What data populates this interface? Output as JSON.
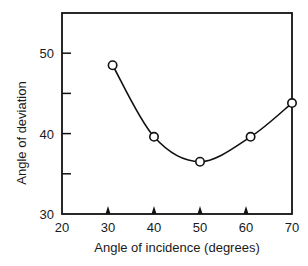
{
  "chart_data": {
    "type": "line",
    "title": "",
    "xlabel": "Angle of incidence (degrees)",
    "ylabel": "Angle of deviation",
    "xlim": [
      20,
      70
    ],
    "ylim": [
      30,
      55
    ],
    "x_ticks": [
      20,
      30,
      40,
      50,
      60,
      70
    ],
    "x_tick_labels": [
      "20",
      "30",
      "40",
      "50",
      "60",
      "70"
    ],
    "y_ticks": [
      30,
      35,
      40,
      45,
      50
    ],
    "y_tick_labels": [
      "30",
      "",
      "40",
      "",
      "50"
    ],
    "x_marker_ticks": [
      30,
      40,
      50,
      60
    ],
    "grid": false,
    "legend": null,
    "series": [
      {
        "name": "deviation",
        "marker": "open-circle",
        "line": "smooth",
        "x": [
          31,
          40,
          50,
          61,
          70
        ],
        "y": [
          48.5,
          39.6,
          36.5,
          39.6,
          43.8
        ]
      }
    ]
  }
}
